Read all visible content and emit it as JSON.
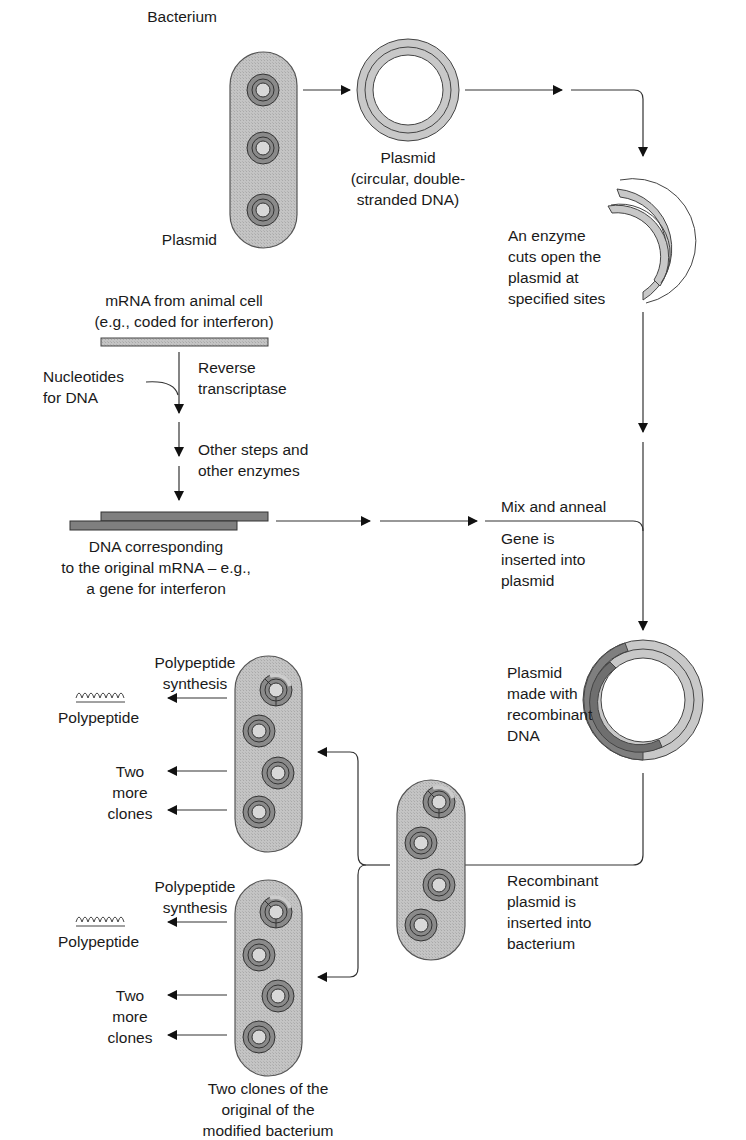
{
  "colors": {
    "cell_fill": "#bdbdbd",
    "cell_stroke": "#555555",
    "plasmid_light": "#c8c8c8",
    "plasmid_dark": "#7f7f7f",
    "ring_dark": "#8a8a8a",
    "line": "#333333",
    "arrow": "#111111",
    "text": "#1a1a1a"
  },
  "labels": {
    "bacterium": "Bacterium",
    "plasmid_in_cell": "Plasmid",
    "plasmid_desc": [
      "Plasmid",
      "(circular, double-",
      "stranded DNA)"
    ],
    "enzyme_cut": [
      "An enzyme",
      "cuts open the",
      "plasmid at",
      "specified sites"
    ],
    "mrna": [
      "mRNA from animal cell",
      "(e.g., coded for interferon)"
    ],
    "nucleotides": [
      "Nucleotides",
      "for DNA"
    ],
    "reverse_transcriptase": [
      "Reverse",
      "transcriptase"
    ],
    "other_steps": [
      "Other steps and",
      "other enzymes"
    ],
    "dna_corresponding": [
      "DNA corresponding",
      "to the original mRNA – e.g.,",
      "a gene for interferon"
    ],
    "mix_anneal": "Mix and anneal",
    "gene_inserted": [
      "Gene is",
      "inserted into",
      "plasmid"
    ],
    "recombinant_plasmid": [
      "Plasmid",
      "made with",
      "recombinant",
      "DNA"
    ],
    "recombinant_inserted": [
      "Recombinant",
      "plasmid is",
      "inserted into",
      "bacterium"
    ],
    "clone_top": {
      "synthesis": [
        "Polypeptide",
        "synthesis"
      ],
      "polypeptide_glyph": "ꝏꝏꝏꝏ",
      "polypeptide": "Polypeptide",
      "more_clones": [
        "Two",
        "more",
        "clones"
      ]
    },
    "clone_bottom": {
      "synthesis": [
        "Polypeptide",
        "synthesis"
      ],
      "polypeptide_glyph": "ꝏꝏꝏꝏ",
      "polypeptide": "Polypeptide",
      "more_clones": [
        "Two",
        "more",
        "clones"
      ]
    },
    "two_clones_caption": [
      "Two clones of the",
      "original of the",
      "modified bacterium"
    ]
  }
}
